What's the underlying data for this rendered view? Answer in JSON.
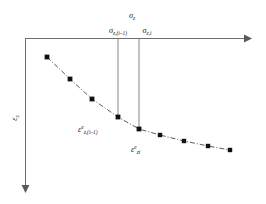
{
  "figure": {
    "kind": "stress-strain-diagram",
    "background_color": "#ffffff",
    "axis_color": "#6e6e6e",
    "curve_color": "#4a4a4a",
    "marker_color": "#111111",
    "dropline_color": "#7a7a7a"
  },
  "axes": {
    "horizontal": {
      "label_symbol": "σ",
      "label_subscript": "z",
      "direction": "right",
      "origin_x": 25,
      "origin_y": 38,
      "end_x": 250
    },
    "vertical": {
      "label_symbol": "ε",
      "label_subscript": "z",
      "direction": "down",
      "origin_x": 25,
      "origin_y": 38,
      "end_y": 192
    }
  },
  "annotations": {
    "sigma_prev": {
      "symbol": "σ",
      "subscript": "z,(i–1)",
      "x": 118,
      "y": 32
    },
    "sigma_curr": {
      "symbol": "σ",
      "subscript": "z,i",
      "x": 141,
      "y": 32
    },
    "strain_prev": {
      "symbol": "ε",
      "superscript": "e",
      "subscript": "z,(i–1)",
      "x": 80,
      "y": 131
    },
    "strain_curr": {
      "symbol": "ε",
      "superscript": "e",
      "subscript": "zi",
      "x": 132,
      "y": 151
    }
  },
  "drop_lines": [
    {
      "name": "dropline-prev",
      "x": 118,
      "y_top": 39,
      "y_bottom": 117
    },
    {
      "name": "dropline-curr",
      "x": 139,
      "y_top": 39,
      "y_bottom": 129
    }
  ],
  "chart_data": {
    "type": "scatter",
    "title": "",
    "xlabel": "σz",
    "ylabel": "εz",
    "grid": false,
    "legend": "none",
    "note": "Decreasing convex dash-dot curve of elastic strain versus stress; vertical axis increases downward.",
    "points_px": [
      [
        47,
        57
      ],
      [
        70,
        79
      ],
      [
        92,
        99
      ],
      [
        118,
        117
      ],
      [
        139,
        129
      ],
      [
        160,
        135
      ],
      [
        184,
        141
      ],
      [
        208,
        146
      ],
      [
        230,
        150
      ]
    ],
    "x": [
      47,
      70,
      92,
      118,
      139,
      160,
      184,
      208,
      230
    ],
    "y": [
      57,
      79,
      99,
      117,
      129,
      135,
      141,
      146,
      150
    ],
    "marker": "square",
    "marker_size_px": 4,
    "line_style": "dash-dot",
    "xlim": [
      25,
      250
    ],
    "ylim": [
      38,
      192
    ]
  }
}
